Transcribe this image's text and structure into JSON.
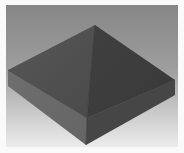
{
  "scene": {
    "description": "3D rendered square box with pyramid top on gradient background",
    "colors": {
      "background_top": "#868686",
      "background_bottom": "#ececec",
      "frame": "#fafafa",
      "pyramid_left_face": "#505050",
      "pyramid_right_face": "#3d3d3d",
      "box_left_side": "#6b6b6b",
      "box_right_side": "#464646",
      "edge": "#2e2e2e"
    },
    "vertices": {
      "apex": [
        95,
        25
      ],
      "left_top": [
        8,
        70
      ],
      "front_top": [
        87,
        118
      ],
      "right_top": [
        175,
        80
      ],
      "left_bottom": [
        8,
        86
      ],
      "front_bottom": [
        86,
        145
      ],
      "right_bottom": [
        175,
        95
      ]
    }
  }
}
